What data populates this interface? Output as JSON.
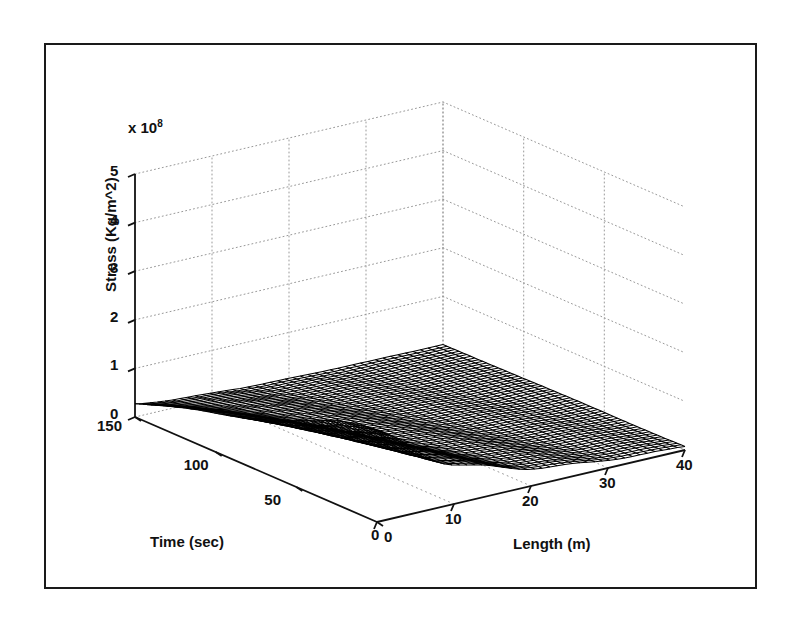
{
  "figure": {
    "background_color": "#ffffff",
    "frame_color": "#1a1a1a",
    "surface_line_color": "#000000",
    "grid_color": "#999999"
  },
  "chart_data": {
    "type": "surface",
    "title": "",
    "xlabel": "Length (m)",
    "ylabel": "Time (sec)",
    "zlabel": "Stress (Kg/m^2)",
    "z_exponent_label": "x 10",
    "z_exponent_value": "8",
    "xlim": [
      0,
      40
    ],
    "ylim": [
      0,
      150
    ],
    "zlim": [
      0,
      5
    ],
    "xticks": [
      0,
      10,
      20,
      30,
      40
    ],
    "xticklabels": [
      "0",
      "10",
      "20",
      "30",
      "40"
    ],
    "yticks": [
      0,
      50,
      100,
      150
    ],
    "yticklabels": [
      "0",
      "50",
      "100",
      "150"
    ],
    "zticks": [
      0,
      1,
      2,
      3,
      4,
      5
    ],
    "zticklabels": [
      "0",
      "1",
      "2",
      "3",
      "4",
      "5"
    ],
    "grid": true,
    "grid_style": "dotted",
    "legend": null,
    "z_scale_factor": 100000000.0,
    "view": {
      "azimuth": -37.5,
      "elevation": 30
    },
    "x_values": [
      0,
      2,
      4,
      6,
      8,
      10,
      12,
      14,
      16,
      18,
      20,
      22,
      24,
      26,
      28,
      30,
      32,
      34,
      36,
      38,
      40
    ],
    "y_values": [
      0,
      5,
      10,
      15,
      20,
      25,
      30,
      35,
      40,
      45,
      50,
      55,
      60,
      65,
      70,
      75,
      80,
      85,
      90,
      95,
      100,
      105,
      110,
      115,
      120,
      125,
      130,
      135,
      140,
      145,
      150
    ],
    "peak": {
      "x": 0,
      "y": 0,
      "z": 1.9
    },
    "series": [
      {
        "name": "t=0",
        "values": [
          1.9,
          1.62,
          1.38,
          1.18,
          1.0,
          0.85,
          0.72,
          0.61,
          0.52,
          0.44,
          0.37,
          0.31,
          0.26,
          0.22,
          0.18,
          0.15,
          0.12,
          0.1,
          0.08,
          0.06,
          0.04
        ]
      },
      {
        "name": "t=25",
        "values": [
          1.55,
          1.33,
          1.13,
          0.96,
          0.82,
          0.69,
          0.59,
          0.5,
          0.42,
          0.36,
          0.3,
          0.25,
          0.21,
          0.18,
          0.15,
          0.12,
          0.1,
          0.08,
          0.06,
          0.05,
          0.03
        ]
      },
      {
        "name": "t=50",
        "values": [
          1.2,
          1.03,
          0.88,
          0.75,
          0.63,
          0.54,
          0.46,
          0.39,
          0.33,
          0.28,
          0.23,
          0.2,
          0.16,
          0.14,
          0.11,
          0.09,
          0.08,
          0.06,
          0.05,
          0.04,
          0.02
        ]
      },
      {
        "name": "t=75",
        "values": [
          0.92,
          0.79,
          0.67,
          0.57,
          0.48,
          0.41,
          0.35,
          0.3,
          0.25,
          0.21,
          0.18,
          0.15,
          0.12,
          0.1,
          0.09,
          0.07,
          0.06,
          0.05,
          0.04,
          0.03,
          0.02
        ]
      },
      {
        "name": "t=100",
        "values": [
          0.68,
          0.58,
          0.5,
          0.42,
          0.36,
          0.3,
          0.26,
          0.22,
          0.18,
          0.16,
          0.13,
          0.11,
          0.09,
          0.08,
          0.06,
          0.05,
          0.04,
          0.03,
          0.03,
          0.02,
          0.01
        ]
      },
      {
        "name": "t=125",
        "values": [
          0.46,
          0.4,
          0.34,
          0.29,
          0.24,
          0.21,
          0.17,
          0.15,
          0.12,
          0.1,
          0.09,
          0.07,
          0.06,
          0.05,
          0.04,
          0.03,
          0.03,
          0.02,
          0.02,
          0.01,
          0.01
        ]
      },
      {
        "name": "t=150",
        "values": [
          0.28,
          0.24,
          0.2,
          0.17,
          0.15,
          0.12,
          0.1,
          0.09,
          0.07,
          0.06,
          0.05,
          0.04,
          0.04,
          0.03,
          0.02,
          0.02,
          0.02,
          0.01,
          0.01,
          0.01,
          0.0
        ]
      }
    ]
  }
}
